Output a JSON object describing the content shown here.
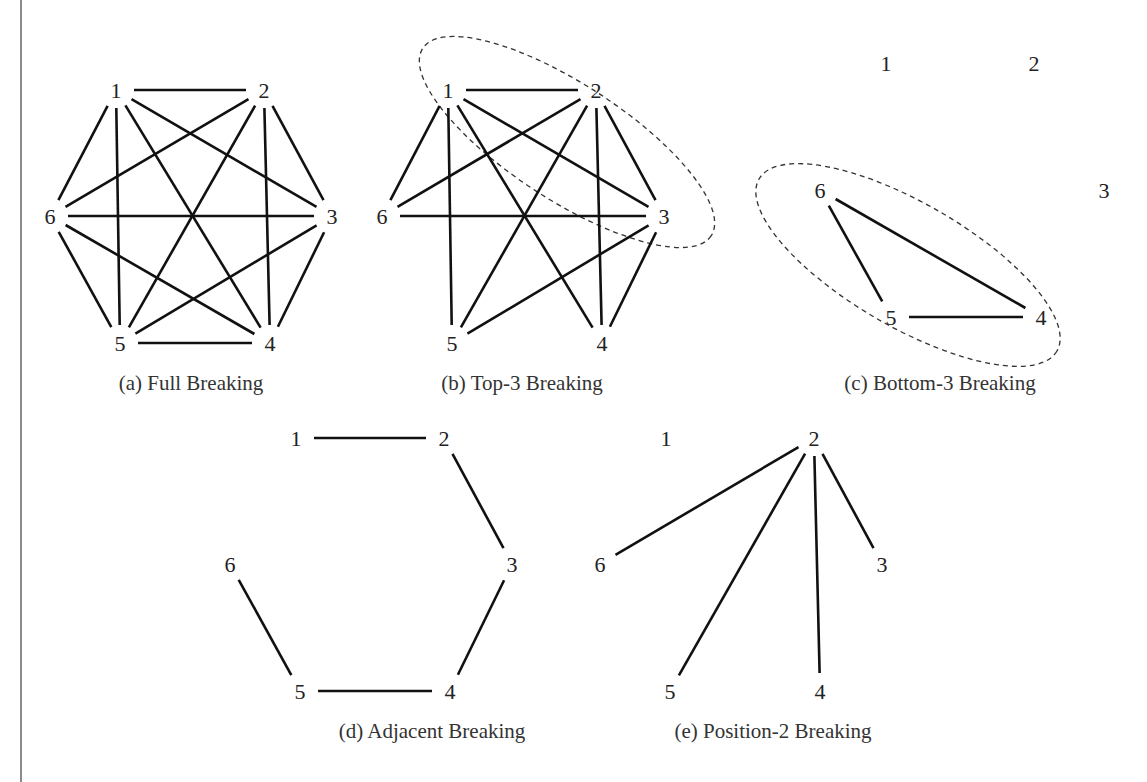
{
  "figure": {
    "panels": [
      {
        "id": "a",
        "caption": "(a) Full Breaking",
        "nodes": [
          "1",
          "2",
          "3",
          "4",
          "5",
          "6"
        ],
        "edges": [
          [
            "1",
            "2"
          ],
          [
            "1",
            "3"
          ],
          [
            "1",
            "4"
          ],
          [
            "1",
            "5"
          ],
          [
            "1",
            "6"
          ],
          [
            "2",
            "3"
          ],
          [
            "2",
            "4"
          ],
          [
            "2",
            "5"
          ],
          [
            "2",
            "6"
          ],
          [
            "3",
            "4"
          ],
          [
            "3",
            "5"
          ],
          [
            "3",
            "6"
          ],
          [
            "4",
            "5"
          ],
          [
            "4",
            "6"
          ],
          [
            "5",
            "6"
          ]
        ],
        "highlighted_group": []
      },
      {
        "id": "b",
        "caption": "(b) Top-3 Breaking",
        "nodes": [
          "1",
          "2",
          "3",
          "4",
          "5",
          "6"
        ],
        "edges": [
          [
            "1",
            "2"
          ],
          [
            "1",
            "3"
          ],
          [
            "1",
            "4"
          ],
          [
            "1",
            "5"
          ],
          [
            "1",
            "6"
          ],
          [
            "2",
            "3"
          ],
          [
            "2",
            "4"
          ],
          [
            "2",
            "5"
          ],
          [
            "2",
            "6"
          ],
          [
            "3",
            "4"
          ],
          [
            "3",
            "5"
          ],
          [
            "3",
            "6"
          ]
        ],
        "highlighted_group": [
          "1",
          "2",
          "3"
        ]
      },
      {
        "id": "c",
        "caption": "(c) Bottom-3  Breaking",
        "nodes": [
          "1",
          "2",
          "3",
          "4",
          "5",
          "6"
        ],
        "edges": [
          [
            "6",
            "5"
          ],
          [
            "6",
            "4"
          ],
          [
            "5",
            "4"
          ]
        ],
        "highlighted_group": [
          "4",
          "5",
          "6"
        ]
      },
      {
        "id": "d",
        "caption": "(d) Adjacent Breaking",
        "nodes": [
          "1",
          "2",
          "3",
          "4",
          "5",
          "6"
        ],
        "edges": [
          [
            "1",
            "2"
          ],
          [
            "2",
            "3"
          ],
          [
            "3",
            "4"
          ],
          [
            "4",
            "5"
          ],
          [
            "5",
            "6"
          ]
        ],
        "highlighted_group": []
      },
      {
        "id": "e",
        "caption": "(e) Position-2 Breaking",
        "nodes": [
          "1",
          "2",
          "3",
          "4",
          "5",
          "6"
        ],
        "edges": [
          [
            "2",
            "3"
          ],
          [
            "2",
            "4"
          ],
          [
            "2",
            "5"
          ],
          [
            "2",
            "6"
          ]
        ],
        "highlighted_group": []
      }
    ]
  }
}
